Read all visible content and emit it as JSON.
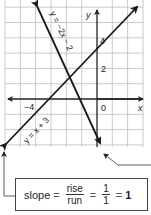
{
  "graph": {
    "x_axis_label": "x",
    "y_axis_label": "y",
    "tick_labels": {
      "x_neg4": "−4",
      "x_neg3": "3",
      "origin": "0",
      "y_2": "2",
      "y_4": "4"
    },
    "lines": [
      {
        "name": "y = x + 3",
        "label": "y = x + 3",
        "slope": 1,
        "intercept": 3
      },
      {
        "name": "y = −2x − 2",
        "label": "y = −2x − 2",
        "slope": -2,
        "intercept": -2
      }
    ],
    "colors": {
      "grid": "#b8b8b8",
      "axis": "#222222",
      "line": "#1a1a1a"
    }
  },
  "slope_box": {
    "prefix": "slope",
    "equals1": "=",
    "rise": "rise",
    "run": "run",
    "equals2": "=",
    "num": "1",
    "den": "1",
    "equals3": "=",
    "result": "1"
  }
}
